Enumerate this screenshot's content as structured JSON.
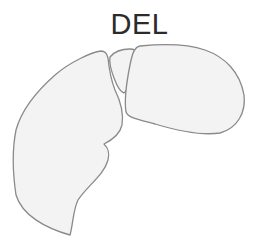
{
  "diagram": {
    "title": "DEL",
    "colors": {
      "background": "#ffffff",
      "lobe_fill": "#f3f3f3",
      "lobe_stroke": "#8a8a8a",
      "title_text": "#2b2b2b"
    },
    "shapes": [
      {
        "id": "left-lobe",
        "label": ""
      },
      {
        "id": "middle-lobe",
        "label": ""
      },
      {
        "id": "right-lobe",
        "label": ""
      }
    ]
  }
}
